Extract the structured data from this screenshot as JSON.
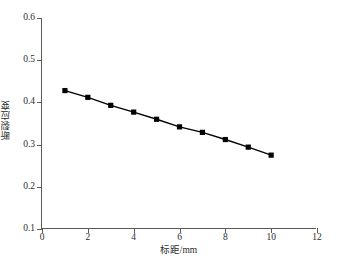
{
  "chart_data": {
    "type": "line",
    "title": "",
    "xlabel": "标距/mm",
    "ylabel": "断裂应变",
    "x": [
      1,
      2,
      3,
      4,
      5,
      6,
      7,
      8,
      9,
      10
    ],
    "values": [
      0.428,
      0.412,
      0.393,
      0.377,
      0.36,
      0.342,
      0.329,
      0.312,
      0.294,
      0.275
    ],
    "series": [
      {
        "name": "断裂应变",
        "values": [
          0.428,
          0.412,
          0.393,
          0.377,
          0.36,
          0.342,
          0.329,
          0.312,
          0.294,
          0.275
        ]
      }
    ],
    "xlim": [
      0,
      12
    ],
    "ylim": [
      0.1,
      0.6
    ],
    "xticks": [
      0,
      2,
      4,
      6,
      8,
      10,
      12
    ],
    "yticks": [
      0.1,
      0.2,
      0.3,
      0.4,
      0.5,
      0.6
    ],
    "xtick_labels": [
      "0",
      "2",
      "4",
      "6",
      "8",
      "10",
      "12"
    ],
    "ytick_labels": [
      "0.1",
      "0.2",
      "0.3",
      "0.4",
      "0.5",
      "0.6"
    ],
    "grid": false,
    "legend": false,
    "legend_position": "none",
    "marker": "square",
    "marker_color": "#000000",
    "line_color": "#000000",
    "background_color": "#ffffff",
    "axis_color": "#5a5a5a"
  }
}
